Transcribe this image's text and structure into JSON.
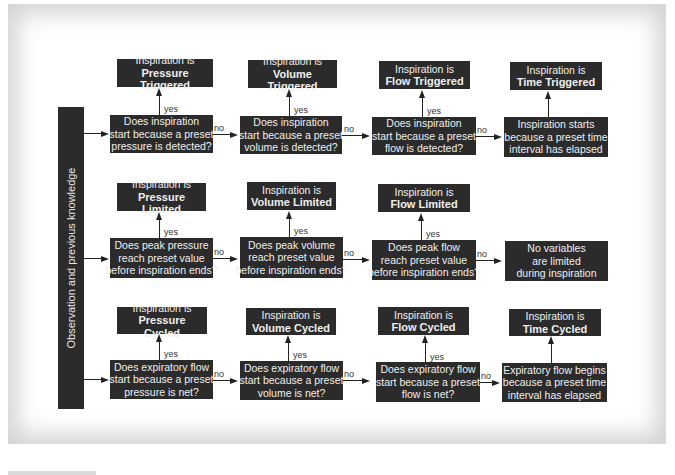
{
  "sidebar": {
    "label": "Observation and previous knowledge"
  },
  "labels": {
    "yes": "yes",
    "no": "no"
  },
  "rows": [
    {
      "name": "trigger",
      "results": [
        {
          "line1": "Inspiration is",
          "line2": "Pressure Triggered"
        },
        {
          "line1": "Inspiration is",
          "line2": "Volume Triggered"
        },
        {
          "line1": "Inspiration is",
          "line2": "Flow Triggered"
        },
        {
          "line1": "Inspiration is",
          "line2": "Time Triggered"
        }
      ],
      "questions": [
        {
          "lines": [
            "Does inspiration",
            "start because a preset",
            "pressure is detected?"
          ]
        },
        {
          "lines": [
            "Does inspiration",
            "start because a preset",
            "volume is detected?"
          ]
        },
        {
          "lines": [
            "Does inspiration",
            "start because a preset",
            "flow is detected?"
          ]
        },
        {
          "lines": [
            "Inspiration starts",
            "because a preset time",
            "interval has elapsed"
          ]
        }
      ]
    },
    {
      "name": "limit",
      "results": [
        {
          "line1": "Inspiration is",
          "line2": "Pressure Limited"
        },
        {
          "line1": "Inspiration is",
          "line2": "Volume Limited"
        },
        {
          "line1": "Inspiration is",
          "line2": "Flow Limited"
        }
      ],
      "questions": [
        {
          "lines": [
            "Does peak pressure",
            "reach preset value",
            "before inspiration ends?"
          ]
        },
        {
          "lines": [
            "Does peak volume",
            "reach preset value",
            "before inspiration ends?"
          ]
        },
        {
          "lines": [
            "Does peak flow",
            "reach preset value",
            "before inspiration ends?"
          ]
        },
        {
          "lines": [
            "No variables",
            "are limited",
            "during inspiration"
          ]
        }
      ]
    },
    {
      "name": "cycle",
      "results": [
        {
          "line1": "Inspiration is",
          "line2": "Pressure Cycled"
        },
        {
          "line1": "Inspiration is",
          "line2": "Volume Cycled"
        },
        {
          "line1": "Inspiration is",
          "line2": "Flow Cycled"
        },
        {
          "line1": "Inspiration is",
          "line2": "Time Cycled"
        }
      ],
      "questions": [
        {
          "lines": [
            "Does expiratory flow",
            "start because a preset",
            "pressure is net?"
          ]
        },
        {
          "lines": [
            "Does expiratory flow",
            "start because a preset",
            "volume is net?"
          ]
        },
        {
          "lines": [
            "Does expiratory flow",
            "start because a preset",
            "flow is net?"
          ]
        },
        {
          "lines": [
            "Expiratory flow begins",
            "because a preset time",
            "interval has elapsed"
          ]
        }
      ]
    }
  ]
}
